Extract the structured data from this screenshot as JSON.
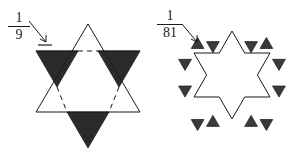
{
  "page": {
    "background_color": "#ffffff",
    "stroke_color": "#1a1a1a",
    "fill_color": "#2b2b2b"
  },
  "figures": [
    {
      "id": "stage-2-one-ninth",
      "name": "hexagram-stage-with-one-ninth-label",
      "label": {
        "numerator": "1",
        "denominator": "9",
        "value_text": "1/9"
      },
      "annotation": {
        "arrow_name": "arrow-to-black-triangle",
        "points_to": "upper-left filled triangular spike",
        "has_tick_mark": true
      },
      "description": "Star of David: upward triangle outlined, downward triangle with three outer spikes filled black and inner hexagon edges dashed",
      "shaded_spike_count": 3,
      "outlined_spike_count": 3,
      "dashed_edges": true
    },
    {
      "id": "stage-3-one-eightyfirst",
      "name": "hexagram-stage-with-one-eightyfirst-label",
      "label": {
        "numerator": "1",
        "denominator": "81",
        "value_text": "1/81"
      },
      "annotation": {
        "arrow_name": "arrow-to-small-black-triangle",
        "points_to": "small filled triangle on upper-left edge",
        "has_tick_mark": false
      },
      "description": "Hexagram outline with twelve small filled triangles attached, one to each of the twelve edges",
      "small_triangle_count": 12
    }
  ],
  "geometry": {
    "left_star": {
      "center_x": 88,
      "center_y": 84,
      "outer_radius": 60,
      "up_triangle_apex_y": 24,
      "down_triangle_base_y": 51,
      "up_triangle_base_y": 112
    },
    "right_star": {
      "center_x": 232,
      "center_y": 84,
      "outer_radius": 53,
      "small_triangle_height": 9
    }
  }
}
